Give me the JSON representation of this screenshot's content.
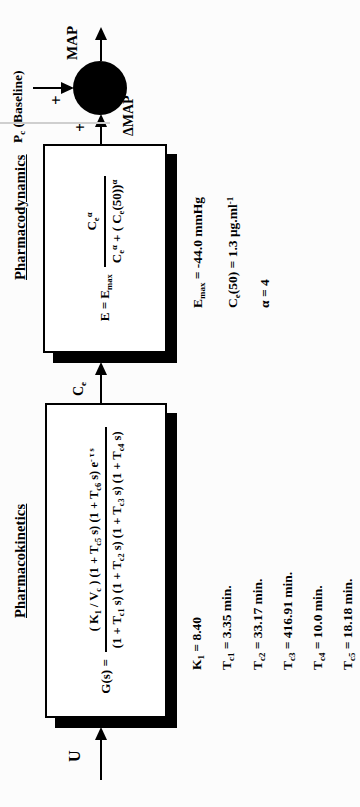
{
  "figure": {
    "pharmacokinetics": {
      "title": "Pharmacokinetics",
      "formula_lhs": "G(s) =",
      "formula_numerator": "( K_{1} / V_{c} ) (1 + T_{c5} s) (1 + T_{c6} s)  e^{- τ s}",
      "formula_denominator": "(1 + T_{c1} s) (1 + T_{c2} s) (1 + T_{c3} s) (1 + T_{c4} s)",
      "parameters": [
        "K_{1} = 8.40",
        "T_{c1} = 3.35 min.",
        "T_{c2} = 33.17 min.",
        "T_{c3} = 416.91 min.",
        "T_{c4} = 10.0 min.",
        "T_{c5} = 18.18 min."
      ]
    },
    "pharmacodynamics": {
      "title": "Pharmacodynamics",
      "formula_lhs": "E = E_{max}",
      "formula_numerator": "C_{e}^{α}",
      "formula_denominator": "C_{e}^{α} + ( C_{e}(50))^{α}",
      "parameters": [
        "E_{max} = -44.0 mmHg",
        "C_{e}(50) = 1.3 μg.ml^{-1}",
        "α = 4"
      ]
    },
    "signals": {
      "input": "U",
      "effect_site_concentration": "C_{e}",
      "delta_map": "ΔMAP",
      "map": "MAP",
      "baseline": "P_{c} (Baseline)",
      "plus_baseline": "+",
      "plus_delta": "+"
    },
    "colors": {
      "ink": "#000000",
      "block_fill": "#ffffff",
      "block_shadow": "#000000",
      "page_bg": "#fcfcfc"
    }
  }
}
